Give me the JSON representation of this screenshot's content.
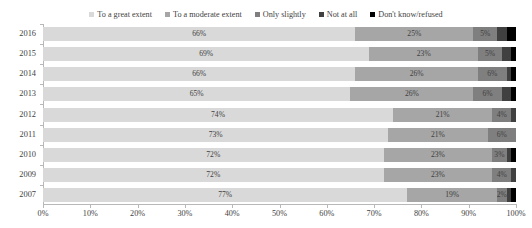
{
  "chart_data": {
    "type": "bar",
    "orientation": "horizontal",
    "stacked": true,
    "normalized_percent": true,
    "title": "",
    "xlabel": "",
    "ylabel": "",
    "xlim": [
      0,
      100
    ],
    "grid": false,
    "legend_position": "top-center",
    "categories": [
      "2016",
      "2015",
      "2014",
      "2013",
      "2012",
      "2011",
      "2010",
      "2009",
      "2007"
    ],
    "tick_labels": [
      "0%",
      "10%",
      "20%",
      "30%",
      "40%",
      "50%",
      "60%",
      "70%",
      "80%",
      "90%",
      "100%"
    ],
    "tick_values": [
      0,
      10,
      20,
      30,
      40,
      50,
      60,
      70,
      80,
      90,
      100
    ],
    "series": [
      {
        "name": "To a great extent",
        "color": "#d9d9d9",
        "values": [
          66,
          69,
          66,
          65,
          74,
          73,
          72,
          72,
          77
        ],
        "labels": [
          "66%",
          "69%",
          "66%",
          "65%",
          "74%",
          "73%",
          "72%",
          "72%",
          "77%"
        ]
      },
      {
        "name": "To a moderate extent",
        "color": "#a6a6a6",
        "values": [
          25,
          23,
          26,
          26,
          21,
          21,
          23,
          23,
          19
        ],
        "labels": [
          "25%",
          "23%",
          "26%",
          "26%",
          "21%",
          "21%",
          "23%",
          "23%",
          "19%"
        ]
      },
      {
        "name": "Only slightly",
        "color": "#7f7f7f",
        "values": [
          5,
          5,
          6,
          6,
          4,
          6,
          3,
          4,
          2
        ],
        "labels": [
          "5%",
          "5%",
          "6%",
          "6%",
          "4%",
          "6%",
          "3%",
          "4%",
          "2%"
        ]
      },
      {
        "name": "Not at all",
        "color": "#404040",
        "values": [
          2,
          2,
          1,
          2,
          1,
          0,
          1,
          1,
          1
        ],
        "labels": [
          "",
          "",
          "",
          "",
          "",
          "",
          "",
          "",
          ""
        ]
      },
      {
        "name": "Don't know/refused",
        "color": "#000000",
        "values": [
          2,
          1,
          1,
          1,
          0,
          0,
          1,
          0,
          1
        ],
        "labels": [
          "",
          "",
          "",
          "",
          "",
          "",
          "",
          "",
          ""
        ]
      }
    ]
  },
  "legend": {
    "items": [
      {
        "label": "To a great extent",
        "color": "#d9d9d9"
      },
      {
        "label": "To a moderate extent",
        "color": "#a6a6a6"
      },
      {
        "label": "Only slightly",
        "color": "#7f7f7f"
      },
      {
        "label": "Not at all",
        "color": "#404040"
      },
      {
        "label": "Don't know/refused",
        "color": "#000000"
      }
    ]
  }
}
